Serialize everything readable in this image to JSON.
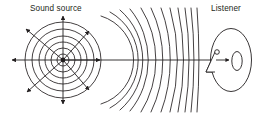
{
  "diagram": {
    "background_color": "#ffffff",
    "stroke_color": "#231f20",
    "text_color": "#231f20",
    "labels": {
      "source_label": "Sound source",
      "listener_label": "Listener"
    },
    "source": {
      "name": "sound-source",
      "center_x": 63,
      "center_y": 60,
      "dot_radius": 2.2,
      "concentric_radii": [
        6,
        12,
        18,
        24,
        31,
        38,
        45
      ]
    },
    "radiating_arrows": {
      "count": 8,
      "directions": [
        "left",
        "up-left",
        "up",
        "up-right",
        "right",
        "down-right",
        "down",
        "down-left"
      ],
      "arrow_length": 50
    },
    "wavefronts": {
      "name": "wavefront-arcs",
      "count": 12,
      "note": "Arcs flatten progressively toward the listener"
    },
    "propagation_ray": {
      "name": "propagation-ray",
      "from_x": 63,
      "to_x": 229,
      "y": 60
    },
    "listener": {
      "name": "listener-head",
      "head_center_x": 230,
      "head_center_y": 60,
      "head_rx": 21,
      "head_ry": 32,
      "eye": {
        "cx": 217,
        "cy": 52,
        "r": 2.3
      },
      "ear": {
        "cx": 237,
        "cy": 61,
        "rx": 5.2,
        "ry": 9.5
      },
      "nose": "triangle"
    }
  }
}
